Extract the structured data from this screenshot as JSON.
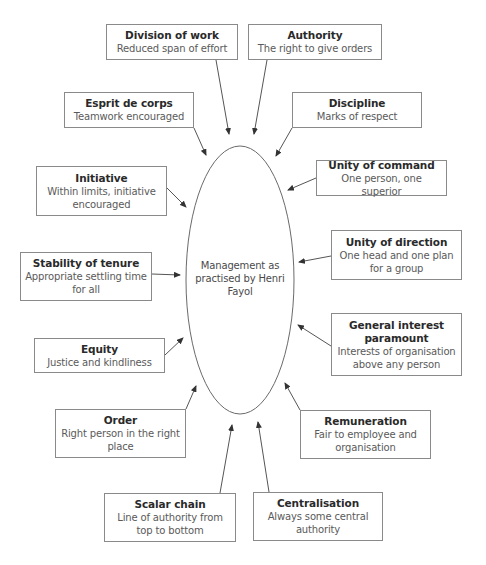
{
  "diagram": {
    "center": {
      "label": "Management as practised by Henri Fayol"
    },
    "principles": [
      {
        "id": "division-of-work",
        "title": "Division of work",
        "description": "Reduced span of effort",
        "box": {
          "x": 106,
          "y": 24,
          "w": 132,
          "h": 36
        },
        "arrow": {
          "x1": 216,
          "y1": 60,
          "x2": 229,
          "y2": 134
        }
      },
      {
        "id": "authority",
        "title": "Authority",
        "description": "The right to give orders",
        "box": {
          "x": 248,
          "y": 24,
          "w": 134,
          "h": 36
        },
        "arrow": {
          "x1": 267,
          "y1": 60,
          "x2": 254,
          "y2": 134
        }
      },
      {
        "id": "esprit-de-corps",
        "title": "Esprit de corps",
        "description": "Teamwork encouraged",
        "box": {
          "x": 64,
          "y": 92,
          "w": 130,
          "h": 36
        },
        "arrow": {
          "x1": 194,
          "y1": 128,
          "x2": 206,
          "y2": 155
        }
      },
      {
        "id": "discipline",
        "title": "Discipline",
        "description": "Marks of respect",
        "box": {
          "x": 292,
          "y": 92,
          "w": 130,
          "h": 36
        },
        "arrow": {
          "x1": 292,
          "y1": 128,
          "x2": 276,
          "y2": 156
        }
      },
      {
        "id": "initiative",
        "title": "Initiative",
        "description": "Within limits, initiative encouraged",
        "box": {
          "x": 36,
          "y": 166,
          "w": 131,
          "h": 50
        },
        "arrow": {
          "x1": 167,
          "y1": 188,
          "x2": 186,
          "y2": 207
        }
      },
      {
        "id": "unity-of-command",
        "title": "Unity of command",
        "description": "One person, one superior",
        "box": {
          "x": 316,
          "y": 160,
          "w": 131,
          "h": 36
        },
        "arrow": {
          "x1": 316,
          "y1": 178,
          "x2": 288,
          "y2": 190
        }
      },
      {
        "id": "unity-of-direction",
        "title": "Unity of direction",
        "description": "One head and one plan for a group",
        "box": {
          "x": 331,
          "y": 230,
          "w": 131,
          "h": 50
        },
        "arrow": {
          "x1": 331,
          "y1": 256,
          "x2": 299,
          "y2": 262
        }
      },
      {
        "id": "stability-of-tenure",
        "title": "Stability of tenure",
        "description": "Appropriate settling time for all",
        "box": {
          "x": 20,
          "y": 252,
          "w": 132,
          "h": 49
        },
        "arrow": {
          "x1": 152,
          "y1": 274,
          "x2": 180,
          "y2": 275
        }
      },
      {
        "id": "general-interest-paramount",
        "title": "General interest paramount",
        "description": "Interests of organisation above any person",
        "box": {
          "x": 331,
          "y": 313,
          "w": 131,
          "h": 63
        },
        "arrow": {
          "x1": 331,
          "y1": 346,
          "x2": 298,
          "y2": 325
        }
      },
      {
        "id": "equity",
        "title": "Equity",
        "description": "Justice and kindliness",
        "box": {
          "x": 34,
          "y": 338,
          "w": 131,
          "h": 35
        },
        "arrow": {
          "x1": 165,
          "y1": 355,
          "x2": 183,
          "y2": 338
        }
      },
      {
        "id": "order",
        "title": "Order",
        "description": "Right person in the right place",
        "box": {
          "x": 55,
          "y": 409,
          "w": 131,
          "h": 49
        },
        "arrow": {
          "x1": 186,
          "y1": 409,
          "x2": 196,
          "y2": 386
        }
      },
      {
        "id": "remuneration",
        "title": "Remuneration",
        "description": "Fair to employee and organisation",
        "box": {
          "x": 300,
          "y": 410,
          "w": 131,
          "h": 49
        },
        "arrow": {
          "x1": 300,
          "y1": 410,
          "x2": 285,
          "y2": 383
        }
      },
      {
        "id": "scalar-chain",
        "title": "Scalar chain",
        "description": "Line of authority from top to bottom",
        "box": {
          "x": 104,
          "y": 493,
          "w": 132,
          "h": 49
        },
        "arrow": {
          "x1": 220,
          "y1": 493,
          "x2": 232,
          "y2": 425
        }
      },
      {
        "id": "centralisation",
        "title": "Centralisation",
        "description": "Always some central authority",
        "box": {
          "x": 253,
          "y": 492,
          "w": 130,
          "h": 49
        },
        "arrow": {
          "x1": 269,
          "y1": 492,
          "x2": 258,
          "y2": 422
        }
      }
    ],
    "colors": {
      "box_border": "#8a8a8a",
      "line": "#555555",
      "title_text": "#2a2a2a",
      "desc_text": "#5a5a5a"
    }
  }
}
